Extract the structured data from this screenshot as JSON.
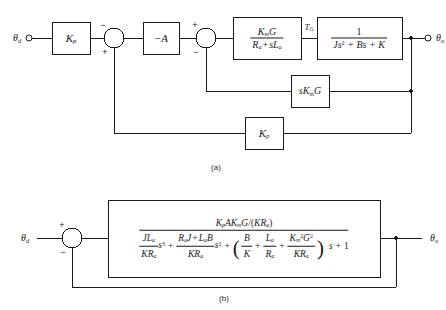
{
  "figure": {
    "header_remnant": "",
    "captions": {
      "a": "(a)",
      "b": "(b)"
    }
  },
  "diagram_a": {
    "input_label": "θ",
    "input_sub": "d",
    "output_label": "θ",
    "output_sub": "o",
    "blocks": [
      {
        "name": "pot-gain",
        "text": "K",
        "sub": "p"
      },
      {
        "name": "amplifier",
        "text": "−A",
        "sub": ""
      },
      {
        "name": "motor-electrical",
        "num": "K",
        "num_sub": "m",
        "num_tail": "G",
        "den_a": "R",
        "den_a_sub": "a",
        "den_op": "+",
        "den_b": "sL",
        "den_b_sub": "a"
      },
      {
        "name": "load-mechanical",
        "num": "1",
        "den": "Js",
        "den_sup": "2",
        "den_rest": "+ Bs + K"
      },
      {
        "name": "back-emf-feedback",
        "text": "sK",
        "sub": "m",
        "tail": "G"
      },
      {
        "name": "position-feedback",
        "text": "K",
        "sub": "p"
      }
    ],
    "signal_label": {
      "text": "T",
      "sub": "G"
    },
    "sum1": {
      "top_sign": "−",
      "bottom_sign": "+"
    },
    "sum2": {
      "top_sign": "+",
      "bottom_sign": "−"
    }
  },
  "diagram_b": {
    "input_label": "θ",
    "input_sub": "d",
    "output_label": "θ",
    "output_sub": "o",
    "sum": {
      "top_sign": "+",
      "bottom_sign": "−"
    },
    "transfer_function": {
      "numerator": {
        "gain_kp": "K",
        "gain_kp_sub": "p",
        "gain_a": "A",
        "gain_km": "K",
        "gain_km_sub": "m",
        "gain_g": "G",
        "divider": "/(",
        "k": "K",
        "ra": "R",
        "ra_sub": "a",
        "close": ")"
      },
      "denominator": {
        "term1": {
          "num": "JL",
          "num_sub": "a",
          "den": "KR",
          "den_sub": "a",
          "power": "s",
          "power_sup": "3"
        },
        "op1": "+",
        "term2": {
          "num_a": "R",
          "num_a_sub": "a",
          "num_b": "J",
          "num_op": "+",
          "num_c": "L",
          "num_c_sub": "a",
          "num_d": "B",
          "den": "KR",
          "den_sub": "a",
          "power": "s",
          "power_sup": "2"
        },
        "op2": "+",
        "group": {
          "open": "(",
          "g1": {
            "num": "B",
            "den": "K"
          },
          "gop1": "+",
          "g2": {
            "num": "L",
            "num_sub": "a",
            "den": "R",
            "den_sub": "a"
          },
          "gop2": "+",
          "g3": {
            "num": "K",
            "num_sub": "m",
            "num_sup": "2",
            "num_tail": "G",
            "num_tail_sup": "2",
            "den": "KR",
            "den_sub": "a"
          },
          "close": ")"
        },
        "tail_s": "s",
        "op3": "+",
        "tail_one": "1"
      }
    }
  }
}
